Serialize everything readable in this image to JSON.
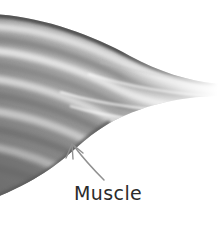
{
  "figure": {
    "type": "anatomical-illustration",
    "subject": "muscle",
    "background_color": "#ffffff",
    "width": 218,
    "height": 225
  },
  "annotations": [
    {
      "id": "muscle",
      "label": "Muscle",
      "label_color": "#2b2b2b",
      "leader_line_color": "#909090",
      "arrow_head": "three-prong-fan",
      "arrow_tip": {
        "x": 72,
        "y": 144
      },
      "label_position": {
        "x": 74,
        "y": 182
      }
    }
  ],
  "illustration": {
    "name": "skeletal-muscle-belly-tapering-to-tendon",
    "description": "Grayscale shaded muscle belly entering from the left, fibers running diagonally and converging toward a pale tendon that fades out at the upper right.",
    "palette": {
      "darkest": "#4a4a4a",
      "dark": "#6d6d6d",
      "mid": "#8d8d8d",
      "light": "#bdbdbd",
      "lightest": "#ededed",
      "white": "#ffffff"
    },
    "fiber_count": 9
  }
}
